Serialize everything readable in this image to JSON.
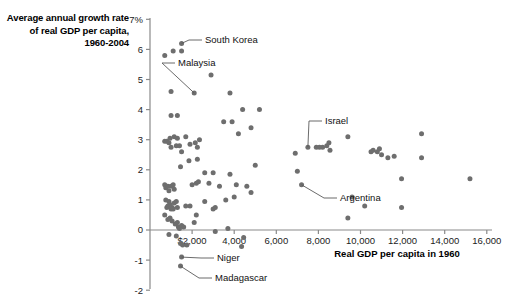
{
  "chart_data": {
    "type": "scatter",
    "title": "Average annual growth rate of real GDP per capita, 1960-2004",
    "xlabel": "Real GDP per capita in 1960",
    "ylabel": "Average annual growth rate of real GDP per capita, 1960-2004",
    "xlim": [
      0,
      16800
    ],
    "ylim": [
      -2,
      7
    ],
    "grid": false,
    "legend": "none",
    "x_ticks": [
      {
        "value": 2000,
        "label": "$2,000"
      },
      {
        "value": 4000,
        "label": "4,000"
      },
      {
        "value": 6000,
        "label": "6,000"
      },
      {
        "value": 8000,
        "label": "8,000"
      },
      {
        "value": 10000,
        "label": "10,000"
      },
      {
        "value": 12000,
        "label": "12,000"
      },
      {
        "value": 14000,
        "label": "14,000"
      },
      {
        "value": 16000,
        "label": "16,000"
      }
    ],
    "y_ticks": [
      {
        "value": 7,
        "label": "7%"
      },
      {
        "value": 6,
        "label": "6"
      },
      {
        "value": 5,
        "label": "5"
      },
      {
        "value": 4,
        "label": "4"
      },
      {
        "value": 3,
        "label": "3"
      },
      {
        "value": 2,
        "label": "2"
      },
      {
        "value": 1,
        "label": "1"
      },
      {
        "value": 0,
        "label": "0"
      },
      {
        "value": -1,
        "label": "-1"
      },
      {
        "value": -2,
        "label": "-2"
      }
    ],
    "points": [
      [
        700,
        5.8
      ],
      [
        1100,
        5.95
      ],
      [
        1500,
        6.2
      ],
      [
        1500,
        5.95
      ],
      [
        2100,
        4.55
      ],
      [
        1000,
        4.6
      ],
      [
        2900,
        5.15
      ],
      [
        3800,
        4.55
      ],
      [
        1000,
        3.8
      ],
      [
        1300,
        3.8
      ],
      [
        4400,
        4.0
      ],
      [
        5200,
        4.0
      ],
      [
        3500,
        3.6
      ],
      [
        4200,
        3.2
      ],
      [
        4800,
        3.4
      ],
      [
        3900,
        3.6
      ],
      [
        700,
        2.95
      ],
      [
        800,
        2.95
      ],
      [
        900,
        2.9
      ],
      [
        950,
        3.05
      ],
      [
        1000,
        2.75
      ],
      [
        1150,
        3.1
      ],
      [
        1300,
        3.05
      ],
      [
        1250,
        2.8
      ],
      [
        1400,
        2.8
      ],
      [
        1500,
        2.6
      ],
      [
        1700,
        3.1
      ],
      [
        1900,
        2.85
      ],
      [
        2150,
        2.9
      ],
      [
        2250,
        2.75
      ],
      [
        2350,
        3.0
      ],
      [
        1850,
        2.3
      ],
      [
        2250,
        2.35
      ],
      [
        1450,
        2.1
      ],
      [
        5000,
        2.15
      ],
      [
        6900,
        2.55
      ],
      [
        7000,
        1.95
      ],
      [
        7500,
        2.75
      ],
      [
        8200,
        2.75
      ],
      [
        8400,
        2.8
      ],
      [
        8500,
        2.9
      ],
      [
        8550,
        2.65
      ],
      [
        9400,
        3.1
      ],
      [
        7900,
        2.75
      ],
      [
        8050,
        2.75
      ],
      [
        10500,
        2.6
      ],
      [
        10600,
        2.65
      ],
      [
        10800,
        2.6
      ],
      [
        10900,
        2.7
      ],
      [
        11000,
        2.5
      ],
      [
        11300,
        2.4
      ],
      [
        11600,
        2.45
      ],
      [
        12900,
        3.2
      ],
      [
        12900,
        2.4
      ],
      [
        11950,
        1.7
      ],
      [
        15200,
        1.7
      ],
      [
        7200,
        1.5
      ],
      [
        700,
        1.5
      ],
      [
        750,
        1.4
      ],
      [
        850,
        1.45
      ],
      [
        900,
        1.3
      ],
      [
        1000,
        1.45
      ],
      [
        1100,
        1.5
      ],
      [
        1150,
        1.35
      ],
      [
        2000,
        1.5
      ],
      [
        2200,
        1.55
      ],
      [
        2300,
        1.6
      ],
      [
        2800,
        1.55
      ],
      [
        3300,
        1.45
      ],
      [
        4100,
        1.5
      ],
      [
        4600,
        1.45
      ],
      [
        4800,
        1.25
      ],
      [
        3000,
        1.9
      ],
      [
        3800,
        1.85
      ],
      [
        2600,
        1.9
      ],
      [
        750,
        1.0
      ],
      [
        800,
        0.75
      ],
      [
        850,
        0.8
      ],
      [
        900,
        0.95
      ],
      [
        950,
        0.85
      ],
      [
        1000,
        0.7
      ],
      [
        1050,
        0.75
      ],
      [
        1100,
        0.7
      ],
      [
        1150,
        0.9
      ],
      [
        1250,
        0.95
      ],
      [
        1300,
        0.75
      ],
      [
        1700,
        0.8
      ],
      [
        1900,
        0.8
      ],
      [
        2200,
        0.5
      ],
      [
        2600,
        0.95
      ],
      [
        3000,
        0.7
      ],
      [
        3100,
        0.75
      ],
      [
        3600,
        1.0
      ],
      [
        4000,
        1.1
      ],
      [
        9600,
        1.1
      ],
      [
        10200,
        0.8
      ],
      [
        11950,
        0.75
      ],
      [
        9400,
        0.4
      ],
      [
        700,
        0.5
      ],
      [
        850,
        0.35
      ],
      [
        950,
        0.4
      ],
      [
        1050,
        0.3
      ],
      [
        1200,
        0.2
      ],
      [
        1300,
        0.25
      ],
      [
        1350,
        0.1
      ],
      [
        1400,
        0.05
      ],
      [
        1500,
        0.15
      ],
      [
        1600,
        0.1
      ],
      [
        2100,
        0.25
      ],
      [
        3100,
        -0.05
      ],
      [
        3700,
        0.05
      ],
      [
        900,
        -0.15
      ],
      [
        1250,
        -0.2
      ],
      [
        1450,
        -0.45
      ],
      [
        1550,
        -0.5
      ],
      [
        1750,
        -0.5
      ],
      [
        4350,
        -0.55
      ],
      [
        4450,
        -0.25
      ],
      [
        1500,
        -0.9
      ],
      [
        1450,
        -1.2
      ]
    ],
    "annotations": [
      {
        "label": "South Korea",
        "point": [
          1500,
          6.2
        ],
        "label_x": 205,
        "label_y": 40
      },
      {
        "label": "Malaysia",
        "point": [
          2100,
          4.55
        ],
        "label_x": 178,
        "label_y": 63
      },
      {
        "label": "Israel",
        "point": [
          7500,
          2.75
        ],
        "label_x": 325,
        "label_y": 121
      },
      {
        "label": "Argentina",
        "point": [
          7200,
          1.5
        ],
        "label_x": 340,
        "label_y": 198
      },
      {
        "label": "Niger",
        "point": [
          1500,
          -0.9
        ],
        "label_x": 217,
        "label_y": 258
      },
      {
        "label": "Madagascar",
        "point": [
          1450,
          -1.2
        ],
        "label_x": 215,
        "label_y": 278
      }
    ],
    "colors": {
      "dot": "#6e6e6e",
      "axis": "#8a8a8a",
      "text": "#111111",
      "background": "#ffffff"
    }
  },
  "titles": {
    "y_axis_title": "Average annual growth rate of real GDP per capita, 1960-2004",
    "x_axis_title": "Real GDP per capita in 1960"
  }
}
